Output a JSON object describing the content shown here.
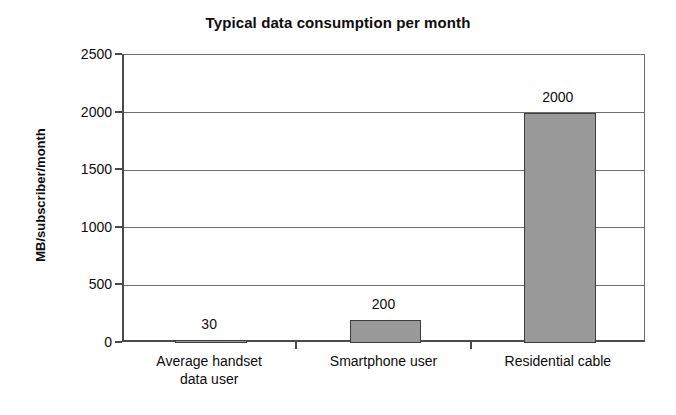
{
  "chart_data": {
    "type": "bar",
    "title": "Typical data consumption per month",
    "xlabel": "",
    "ylabel": "MB/subscriber/month",
    "categories": [
      "Average handset data user",
      "Smartphone user",
      "Residential cable"
    ],
    "category_lines": [
      [
        "Average handset",
        "data user"
      ],
      [
        "Smartphone user"
      ],
      [
        "Residential cable"
      ]
    ],
    "values": [
      30,
      200,
      2000
    ],
    "value_labels": [
      "30",
      "200",
      "2000"
    ],
    "ylim": [
      0,
      2500
    ],
    "ytick_values": [
      0,
      500,
      1000,
      1500,
      2000,
      2500
    ],
    "ytick_labels": [
      "0",
      "500",
      "1000",
      "1500",
      "2000",
      "2500"
    ],
    "grid": true,
    "grid_axis": "y",
    "legend": false,
    "legend_position": "none",
    "bar_fill_color": "#999999",
    "bar_border_color": "#3d3d3d",
    "axis_color": "#4a4a4a",
    "grid_color": "#6e6e6e",
    "background_color": "#ffffff",
    "text_color": "#0d0d0d"
  }
}
